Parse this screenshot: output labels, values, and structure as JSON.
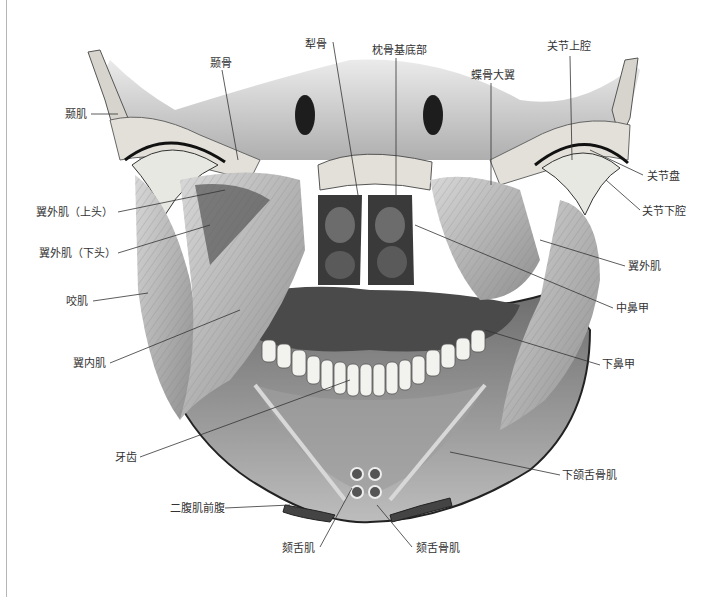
{
  "figure": {
    "colors": {
      "leader_line": "#333333",
      "label_text": "#333333",
      "bone": "#d9d9d6",
      "muscle": "#bdbdbd",
      "cavity": "#3a3a3a",
      "background": "#ffffff"
    }
  },
  "labels": {
    "temporalis": "颞肌",
    "temporal_bone": "颞骨",
    "vomer": "犁骨",
    "basilar_occipital": "枕骨基底部",
    "sphenoid_greater_wing": "蝶骨大翼",
    "superior_joint_cavity": "关节上腔",
    "articular_disc": "关节盘",
    "inferior_joint_cavity": "关节下腔",
    "lateral_pterygoid_upper": "翼外肌（上头）",
    "lateral_pterygoid_lower": "翼外肌（下头）",
    "lateral_pterygoid": "翼外肌",
    "masseter": "咬肌",
    "middle_nasal_concha": "中鼻甲",
    "medial_pterygoid": "翼内肌",
    "inferior_nasal_concha": "下鼻甲",
    "teeth": "牙齿",
    "mylohyoid": "下颌舌骨肌",
    "digastric_anterior_belly": "二腹肌前腹",
    "genioglossus": "颏舌肌",
    "geniohyoid": "颏舌骨肌"
  }
}
